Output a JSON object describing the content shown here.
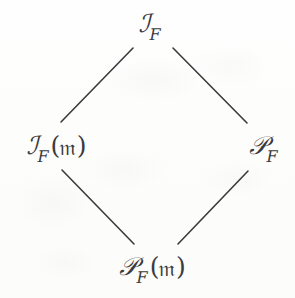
{
  "diagram": {
    "type": "hasse-lattice-diamond",
    "title": "",
    "ink_color": "#3b3b3d",
    "background_color": "#fdfdfd",
    "nodes": [
      {
        "id": "top",
        "position": "top",
        "latex": "\\mathcal{I}_F",
        "script_letter": "ℐ",
        "subscript": "F",
        "argument": "",
        "x": 150,
        "y": 25
      },
      {
        "id": "left",
        "position": "left",
        "latex": "\\mathcal{I}_F(\\mathfrak{m})",
        "script_letter": "ℐ",
        "subscript": "F",
        "argument": "(𝔪)",
        "open_paren": "(",
        "fraktur_m": "𝔪",
        "close_paren": ")",
        "x": 56,
        "y": 147
      },
      {
        "id": "right",
        "position": "right",
        "latex": "\\mathcal{P}_F",
        "script_letter": "𝒫",
        "subscript": "F",
        "argument": "",
        "x": 264,
        "y": 147
      },
      {
        "id": "bottom",
        "position": "bottom",
        "latex": "\\mathcal{P}_F(\\mathfrak{m})",
        "script_letter": "𝒫",
        "subscript": "F",
        "argument": "(𝔪)",
        "open_paren": "(",
        "fraktur_m": "𝔪",
        "close_paren": ")",
        "x": 152,
        "y": 268
      }
    ],
    "edges": [
      {
        "id": "edge-top-left",
        "from": "left",
        "to": "top",
        "x1": 61,
        "y1": 122,
        "x2": 133,
        "y2": 48
      },
      {
        "id": "edge-top-right",
        "from": "top",
        "to": "right",
        "x1": 173,
        "y1": 48,
        "x2": 247,
        "y2": 123
      },
      {
        "id": "edge-bottom-left",
        "from": "left",
        "to": "bottom",
        "x1": 62,
        "y1": 170,
        "x2": 134,
        "y2": 244
      },
      {
        "id": "edge-bottom-right",
        "from": "bottom",
        "to": "right",
        "x1": 178,
        "y1": 244,
        "x2": 248,
        "y2": 171
      }
    ],
    "edge_stroke_width": 1.6
  }
}
